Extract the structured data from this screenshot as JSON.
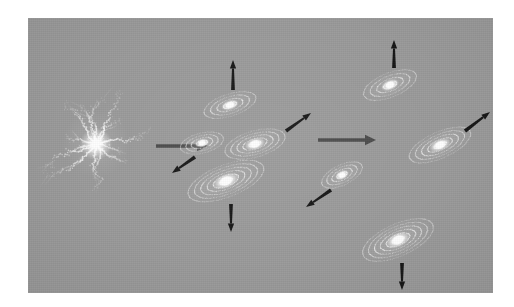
{
  "figure": {
    "page_background": "#ffffff",
    "panel": {
      "background": "#9a9a9a",
      "x": 28,
      "y": 18,
      "width": 465,
      "height": 275
    },
    "colors": {
      "panel_gray": "#9a9a9a",
      "galaxy_white": "#ffffff",
      "galaxy_ring": "#f2f2f2",
      "velocity_arrow_black": "#151515",
      "stage_arrow_gray": "#4a4a4a"
    }
  },
  "stages": [
    {
      "id": "stage-1",
      "name": "protogalaxy",
      "label": "Irregular protogalactic cloud"
    },
    {
      "id": "stage-2",
      "name": "early-disk-group",
      "label": "Early disk galaxies with random motions"
    },
    {
      "id": "stage-3",
      "name": "evolved-disk-group",
      "label": "Evolved spiral galaxies with ordered motions"
    }
  ],
  "protogalaxy": {
    "name": "filamentary-protogalaxy",
    "cx": 68,
    "cy": 126,
    "core_radius": 7,
    "filament_count": 14,
    "extent": 62
  },
  "stage_arrows": [
    {
      "name": "stage-arrow-1",
      "x1": 128,
      "y1": 128,
      "x2": 180,
      "y2": 128,
      "color": "#4a4a4a"
    },
    {
      "name": "stage-arrow-2",
      "x1": 290,
      "y1": 122,
      "x2": 348,
      "y2": 122,
      "color": "#4a4a4a"
    }
  ],
  "galaxies": [
    {
      "id": "g1",
      "name": "galaxy-stage2-top",
      "cx": 202,
      "cy": 87,
      "rx": 27,
      "ry": 11,
      "angle": -18,
      "rings": 4,
      "stage": 2
    },
    {
      "id": "g2",
      "name": "galaxy-stage2-left",
      "cx": 174,
      "cy": 125,
      "rx": 22,
      "ry": 10,
      "angle": -14,
      "rings": 4,
      "stage": 2
    },
    {
      "id": "g3",
      "name": "galaxy-stage2-middle",
      "cx": 227,
      "cy": 126,
      "rx": 31,
      "ry": 13,
      "angle": -16,
      "rings": 5,
      "stage": 2
    },
    {
      "id": "g4",
      "name": "galaxy-stage2-large",
      "cx": 198,
      "cy": 163,
      "rx": 40,
      "ry": 16,
      "angle": -21,
      "rings": 6,
      "stage": 2
    },
    {
      "id": "g5",
      "name": "galaxy-stage3-top",
      "cx": 362,
      "cy": 67,
      "rx": 28,
      "ry": 12,
      "angle": -22,
      "rings": 4,
      "stage": 3
    },
    {
      "id": "g6",
      "name": "galaxy-stage3-small",
      "cx": 314,
      "cy": 157,
      "rx": 22,
      "ry": 10,
      "angle": -26,
      "rings": 4,
      "stage": 3
    },
    {
      "id": "g7",
      "name": "galaxy-stage3-right",
      "cx": 412,
      "cy": 127,
      "rx": 33,
      "ry": 13,
      "angle": -24,
      "rings": 5,
      "stage": 3
    },
    {
      "id": "g8",
      "name": "galaxy-stage3-bottom",
      "cx": 370,
      "cy": 222,
      "rx": 38,
      "ry": 16,
      "angle": -24,
      "rings": 6,
      "stage": 3
    }
  ],
  "velocity_arrows": [
    {
      "id": "v1",
      "name": "velocity-arrow-up-stage2",
      "galaxy": "g1",
      "x1": 205,
      "y1": 72,
      "x2": 205,
      "y2": 42,
      "direction": "up"
    },
    {
      "id": "v2",
      "name": "velocity-arrow-downleft-stage2",
      "galaxy": "g2",
      "x1": 167,
      "y1": 139,
      "x2": 144,
      "y2": 155,
      "direction": "down-left"
    },
    {
      "id": "v3",
      "name": "velocity-arrow-upright-stage2",
      "galaxy": "g3",
      "x1": 258,
      "y1": 113,
      "x2": 283,
      "y2": 95,
      "direction": "up-right"
    },
    {
      "id": "v4",
      "name": "velocity-arrow-down-stage2",
      "galaxy": "g4",
      "x1": 203,
      "y1": 186,
      "x2": 203,
      "y2": 214,
      "direction": "down"
    },
    {
      "id": "v5",
      "name": "velocity-arrow-up-stage3",
      "galaxy": "g5",
      "x1": 366,
      "y1": 50,
      "x2": 366,
      "y2": 22,
      "direction": "up"
    },
    {
      "id": "v6",
      "name": "velocity-arrow-downleft-stage3",
      "galaxy": "g6",
      "x1": 303,
      "y1": 172,
      "x2": 278,
      "y2": 189,
      "direction": "down-left"
    },
    {
      "id": "v7",
      "name": "velocity-arrow-upright-stage3",
      "galaxy": "g7",
      "x1": 437,
      "y1": 113,
      "x2": 462,
      "y2": 94,
      "direction": "up-right"
    },
    {
      "id": "v8",
      "name": "velocity-arrow-down-stage3",
      "galaxy": "g8",
      "x1": 374,
      "y1": 245,
      "x2": 374,
      "y2": 272,
      "direction": "down"
    }
  ],
  "chart_data": {
    "type": "diagram",
    "stage_count": 3,
    "galaxy_count": 8,
    "velocity_arrow_count": 8,
    "stage_arrow_count": 2
  }
}
